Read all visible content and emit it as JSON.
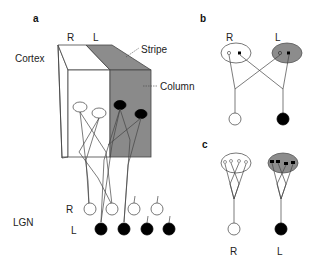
{
  "panels": {
    "a": {
      "label": "a",
      "eye_labels": {
        "right": "R",
        "left": "L"
      },
      "region_cortex": "Cortex",
      "region_lgn": "LGN",
      "annotations": {
        "stripe": "Stripe",
        "column": "Column"
      },
      "lgn_rows": {
        "right": "R",
        "left": "L"
      },
      "lgn_right_cells": 4,
      "lgn_left_cells": 4
    },
    "b": {
      "label": "b",
      "eye_labels": {
        "right": "R",
        "left": "L"
      }
    },
    "c": {
      "label": "c",
      "eye_labels": {
        "right": "R",
        "left": "L"
      }
    }
  },
  "colors": {
    "stripe_gray": "#8c8c8c",
    "line": "#444444",
    "filled_cell": "#000000",
    "open_cell": "#ffffff"
  }
}
